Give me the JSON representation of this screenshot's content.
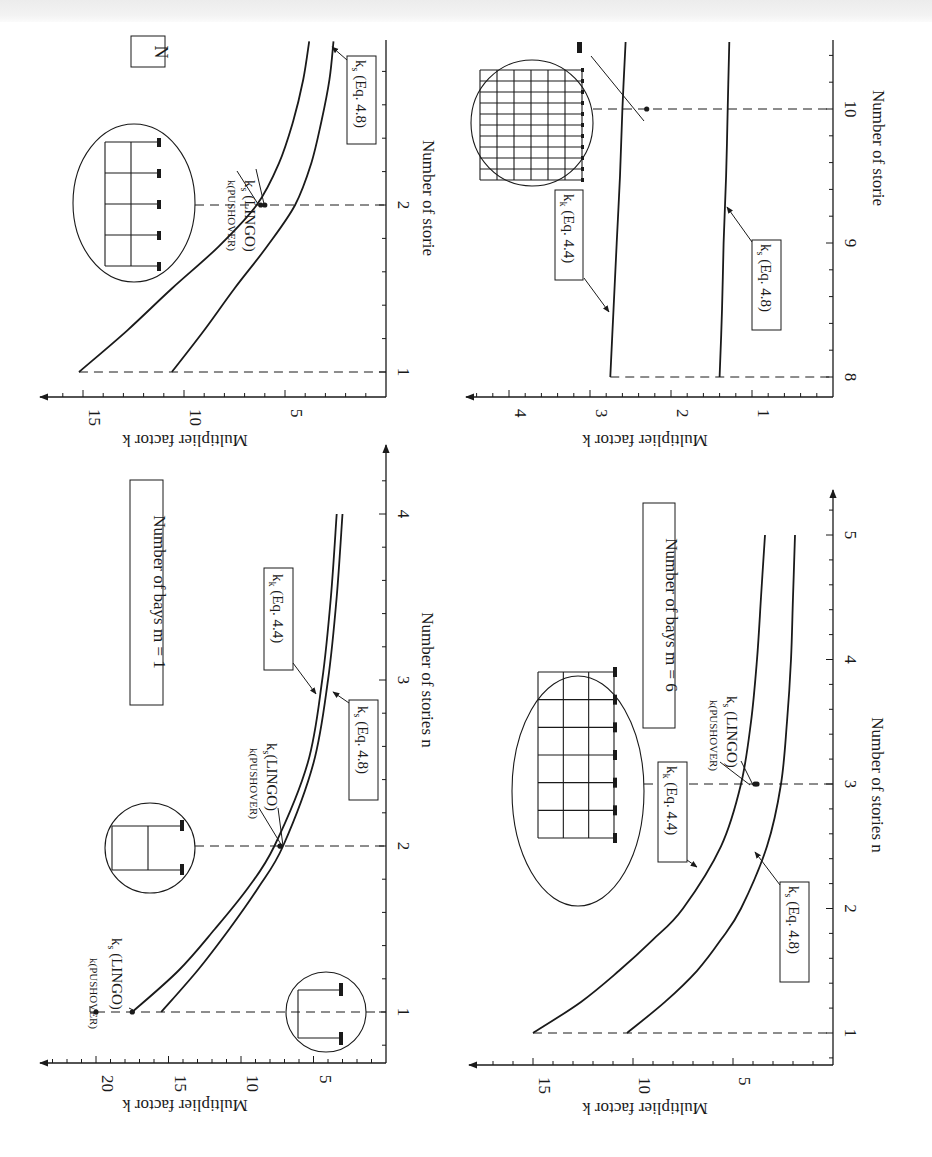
{
  "labels": {
    "ylabel": "Multiplier factor  k",
    "xlabel": "Number of stories  n",
    "xlabel_cut": "Number of storie",
    "kk_label": "k",
    "kk_sub": "k",
    "kk_eq": " (Eq. 4.4)",
    "ks_label": "k",
    "ks_sub": "s",
    "ks_eq": " (Eq. 4.8)",
    "pushover": "k(PUSHOVER)",
    "lingo": " (LINGO)",
    "lingo_tight": "(LINGO)"
  },
  "chart_data": [
    {
      "id": "m4",
      "type": "line",
      "title": "Number of bays  m = 4",
      "title_visible": "N",
      "xlabel": "Number of stories",
      "ylabel": "Multiplier factor  k",
      "x_ticks": [
        1,
        2
      ],
      "y_ticks": [
        5,
        10,
        15
      ],
      "xlim": [
        1,
        3
      ],
      "ylim": [
        0,
        17
      ],
      "series": [
        {
          "name": "k_k (Eq. 4.4)",
          "x": [
            1,
            1.25,
            1.5,
            1.75,
            2,
            2.25,
            2.5,
            2.75,
            2.98
          ],
          "values": [
            15.2,
            12.8,
            10.6,
            8.3,
            6.4,
            5.3,
            4.6,
            4.1,
            3.8
          ]
        },
        {
          "name": "k_s (Eq. 4.8)",
          "x": [
            1,
            1.25,
            1.5,
            1.75,
            2,
            2.25,
            2.5,
            2.75,
            2.98
          ],
          "values": [
            10.6,
            9.0,
            7.5,
            5.9,
            4.5,
            3.7,
            3.2,
            2.8,
            2.6
          ]
        }
      ],
      "points": [
        {
          "name": "k(PUSHOVER)",
          "x": 2,
          "y": 6.2
        },
        {
          "name": "k_s (LINGO)",
          "x": 2,
          "y": 6.0
        }
      ],
      "annotations": [
        "k(PUSHOVER)",
        "k_s (LINGO)",
        "k_s (Eq. 4.8)"
      ]
    },
    {
      "id": "m1",
      "type": "line",
      "title": "Number of bays  m = 1",
      "xlabel": "Number of stories  n",
      "ylabel": "Multiplier factor  k",
      "x_ticks": [
        1,
        2,
        3,
        4
      ],
      "y_ticks": [
        5,
        10,
        15,
        20
      ],
      "xlim": [
        1,
        4
      ],
      "ylim": [
        0,
        23
      ],
      "series": [
        {
          "name": "k_k (Eq. 4.4)",
          "x": [
            1,
            1.25,
            1.5,
            1.75,
            2,
            2.5,
            3,
            3.5,
            4
          ],
          "values": [
            17.5,
            14.3,
            11.8,
            9.5,
            7.7,
            5.4,
            4.4,
            3.8,
            3.4
          ]
        },
        {
          "name": "k_s (Eq. 4.8)",
          "x": [
            1,
            1.25,
            1.5,
            1.75,
            2,
            2.5,
            3,
            3.5,
            4
          ],
          "values": [
            15.5,
            13.0,
            10.8,
            8.8,
            7.1,
            5.0,
            4.0,
            3.4,
            3.0
          ]
        }
      ],
      "points": [
        {
          "name": "k(PUSHOVER)",
          "x": 1,
          "y": 20.0
        },
        {
          "name": "k_s (LINGO)",
          "x": 1,
          "y": 17.5
        },
        {
          "name": "k(PUSHOVER)",
          "x": 2,
          "y": 7.3
        },
        {
          "name": "k_s (LINGO)",
          "x": 2,
          "y": 7.3
        }
      ],
      "annotations": [
        "k(PUSHOVER)",
        "k_s (LINGO)",
        "k_k (Eq. 4.4)",
        "k_s (Eq. 4.8)"
      ]
    },
    {
      "id": "m_tall",
      "type": "line",
      "title": "",
      "xlabel": "Number of stories",
      "ylabel": "Multiplier factor  k",
      "x_ticks": [
        8,
        9,
        10
      ],
      "y_ticks": [
        1,
        2,
        3,
        4
      ],
      "xlim": [
        8,
        10.5
      ],
      "ylim": [
        0,
        4.5
      ],
      "series": [
        {
          "name": "k_k (Eq. 4.4)",
          "x": [
            8,
            8.5,
            9,
            9.5,
            10,
            10.5
          ],
          "values": [
            2.75,
            2.71,
            2.67,
            2.63,
            2.6,
            2.56
          ]
        },
        {
          "name": "k_s (Eq. 4.8)",
          "x": [
            8,
            8.5,
            9,
            9.5,
            10,
            10.5
          ],
          "values": [
            1.4,
            1.37,
            1.35,
            1.32,
            1.3,
            1.28
          ]
        }
      ],
      "points": [
        {
          "name": "k(PUSHOVER)",
          "x": 10,
          "y": 2.3
        }
      ],
      "annotations": [
        "k_k (Eq. 4.4)",
        "k_s (Eq. 4.8)"
      ]
    },
    {
      "id": "m6",
      "type": "line",
      "title": "Number of bays  m = 6",
      "xlabel": "Number of stories  n",
      "ylabel": "Multiplier factor  k",
      "x_ticks": [
        1,
        2,
        3,
        4,
        5
      ],
      "y_ticks": [
        5,
        10,
        15
      ],
      "xlim": [
        1,
        5
      ],
      "ylim": [
        0,
        17.5
      ],
      "series": [
        {
          "name": "k_k (Eq. 4.4)",
          "x": [
            1,
            1.25,
            1.5,
            1.75,
            2,
            2.5,
            3,
            3.5,
            4,
            4.5,
            5
          ],
          "values": [
            15.0,
            12.6,
            10.7,
            9.0,
            7.5,
            5.6,
            4.6,
            4.1,
            3.8,
            3.6,
            3.4
          ]
        },
        {
          "name": "k_s (Eq. 4.8)",
          "x": [
            1,
            1.25,
            1.5,
            1.75,
            2,
            2.5,
            3,
            3.5,
            4,
            4.5,
            5
          ],
          "values": [
            10.3,
            8.4,
            6.8,
            5.6,
            4.6,
            3.3,
            2.6,
            2.3,
            2.1,
            2.0,
            1.9
          ]
        }
      ],
      "points": [
        {
          "name": "k(PUSHOVER)",
          "x": 3,
          "y": 3.9
        },
        {
          "name": "k_s (LINGO)",
          "x": 3,
          "y": 3.8
        }
      ],
      "annotations": [
        "k(PUSHOVER)",
        "k_s (LINGO)",
        "k_k (Eq. 4.4)",
        "k_s (Eq. 4.8)"
      ]
    }
  ]
}
